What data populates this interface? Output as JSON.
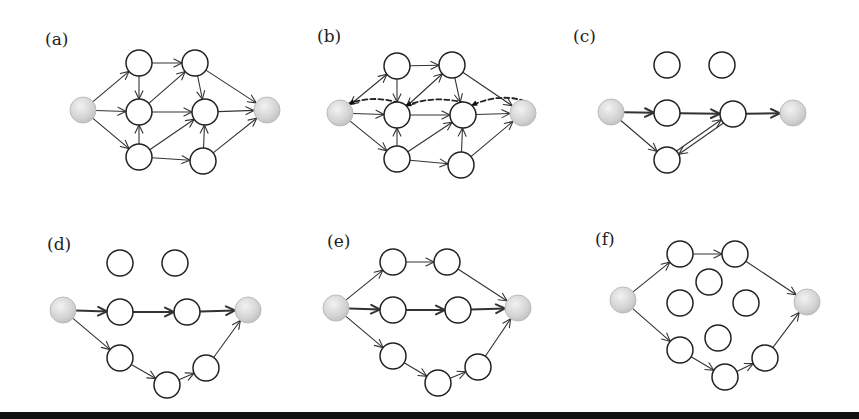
{
  "figure": {
    "node_radius": 13,
    "colors": {
      "node_fill": "#ffffff",
      "node_stroke": "#222222",
      "terminal_fill": "#d8d8d8",
      "edge": "#333333",
      "band": "#111111"
    },
    "panels": [
      {
        "id": "a",
        "label": "(a)",
        "label_pos": [
          45,
          45
        ],
        "nodes": [
          {
            "id": "s",
            "x": 83,
            "y": 110,
            "type": "terminal"
          },
          {
            "id": "a1",
            "x": 139,
            "y": 63
          },
          {
            "id": "a2",
            "x": 195,
            "y": 63
          },
          {
            "id": "b1",
            "x": 139,
            "y": 112
          },
          {
            "id": "b2",
            "x": 205,
            "y": 112
          },
          {
            "id": "c1",
            "x": 139,
            "y": 157
          },
          {
            "id": "c2",
            "x": 203,
            "y": 161
          },
          {
            "id": "t",
            "x": 267,
            "y": 110,
            "type": "terminal"
          }
        ],
        "edges": [
          {
            "from": "s",
            "to": "a1"
          },
          {
            "from": "s",
            "to": "b1"
          },
          {
            "from": "s",
            "to": "c1"
          },
          {
            "from": "a1",
            "to": "a2"
          },
          {
            "from": "a1",
            "to": "b1"
          },
          {
            "from": "c1",
            "to": "b1"
          },
          {
            "from": "b1",
            "to": "a2"
          },
          {
            "from": "b1",
            "to": "b2"
          },
          {
            "from": "c1",
            "to": "b2"
          },
          {
            "from": "c1",
            "to": "c2"
          },
          {
            "from": "a2",
            "to": "b2"
          },
          {
            "from": "c2",
            "to": "b2"
          },
          {
            "from": "a2",
            "to": "t"
          },
          {
            "from": "b2",
            "to": "t"
          },
          {
            "from": "c2",
            "to": "t"
          }
        ]
      },
      {
        "id": "b",
        "label": "(b)",
        "label_pos": [
          317,
          42
        ],
        "nodes": [
          {
            "id": "s",
            "x": 340,
            "y": 113,
            "type": "terminal"
          },
          {
            "id": "a1",
            "x": 397,
            "y": 66
          },
          {
            "id": "a2",
            "x": 452,
            "y": 65
          },
          {
            "id": "b1",
            "x": 397,
            "y": 115
          },
          {
            "id": "b2",
            "x": 463,
            "y": 115
          },
          {
            "id": "c1",
            "x": 397,
            "y": 159
          },
          {
            "id": "c2",
            "x": 461,
            "y": 165
          },
          {
            "id": "t",
            "x": 523,
            "y": 113,
            "type": "terminal"
          }
        ],
        "edges": [
          {
            "from": "s",
            "to": "a1",
            "bidirectional": true
          },
          {
            "from": "s",
            "to": "b1"
          },
          {
            "from": "s",
            "to": "c1"
          },
          {
            "from": "a1",
            "to": "a2"
          },
          {
            "from": "a1",
            "to": "b1"
          },
          {
            "from": "c1",
            "to": "b1"
          },
          {
            "from": "b1",
            "to": "a2",
            "bidirectional": true
          },
          {
            "from": "b1",
            "to": "b2"
          },
          {
            "from": "c1",
            "to": "b2"
          },
          {
            "from": "c1",
            "to": "c2"
          },
          {
            "from": "a2",
            "to": "b2"
          },
          {
            "from": "c2",
            "to": "b2"
          },
          {
            "from": "a2",
            "to": "t"
          },
          {
            "from": "b2",
            "to": "t"
          },
          {
            "from": "c2",
            "to": "t"
          },
          {
            "from": "b1",
            "to": "s",
            "style": "dashed",
            "curve": -14
          },
          {
            "from": "b2",
            "to": "b1",
            "style": "dashed",
            "curve": -14
          },
          {
            "from": "t",
            "to": "b2",
            "style": "dashed",
            "curve": -14
          }
        ]
      },
      {
        "id": "c",
        "label": "(c)",
        "label_pos": [
          573,
          42
        ],
        "nodes": [
          {
            "id": "s",
            "x": 611,
            "y": 112,
            "type": "terminal"
          },
          {
            "id": "i1",
            "x": 667,
            "y": 65
          },
          {
            "id": "i2",
            "x": 722,
            "y": 65
          },
          {
            "id": "b1",
            "x": 667,
            "y": 113
          },
          {
            "id": "b2",
            "x": 733,
            "y": 114
          },
          {
            "id": "c1",
            "x": 667,
            "y": 160
          },
          {
            "id": "t",
            "x": 793,
            "y": 113,
            "type": "terminal"
          }
        ],
        "edges": [
          {
            "from": "s",
            "to": "b1",
            "style": "thick"
          },
          {
            "from": "b1",
            "to": "b2",
            "style": "thick"
          },
          {
            "from": "b2",
            "to": "t",
            "style": "thick"
          },
          {
            "from": "s",
            "to": "c1"
          },
          {
            "from": "c1",
            "to": "b2",
            "offset": -2
          },
          {
            "from": "b2",
            "to": "c1",
            "offset": -2
          }
        ]
      },
      {
        "id": "d",
        "label": "(d)",
        "label_pos": [
          47,
          250
        ],
        "nodes": [
          {
            "id": "s",
            "x": 63,
            "y": 310,
            "type": "terminal"
          },
          {
            "id": "i1",
            "x": 120,
            "y": 263
          },
          {
            "id": "i2",
            "x": 175,
            "y": 263
          },
          {
            "id": "b1",
            "x": 120,
            "y": 312
          },
          {
            "id": "b2",
            "x": 187,
            "y": 312
          },
          {
            "id": "c1",
            "x": 120,
            "y": 358
          },
          {
            "id": "c2",
            "x": 167,
            "y": 385
          },
          {
            "id": "c3",
            "x": 206,
            "y": 368
          },
          {
            "id": "t",
            "x": 248,
            "y": 310,
            "type": "terminal"
          }
        ],
        "edges": [
          {
            "from": "s",
            "to": "b1",
            "style": "thick"
          },
          {
            "from": "b1",
            "to": "b2",
            "style": "thick"
          },
          {
            "from": "b2",
            "to": "t",
            "style": "thick"
          },
          {
            "from": "s",
            "to": "c1"
          },
          {
            "from": "c1",
            "to": "c2"
          },
          {
            "from": "c2",
            "to": "c3"
          },
          {
            "from": "c3",
            "to": "t"
          }
        ]
      },
      {
        "id": "e",
        "label": "(e)",
        "label_pos": [
          327,
          247
        ],
        "nodes": [
          {
            "id": "s",
            "x": 336,
            "y": 308,
            "type": "terminal"
          },
          {
            "id": "a1",
            "x": 393,
            "y": 262
          },
          {
            "id": "a2",
            "x": 447,
            "y": 262
          },
          {
            "id": "b1",
            "x": 393,
            "y": 310
          },
          {
            "id": "b2",
            "x": 458,
            "y": 310
          },
          {
            "id": "c1",
            "x": 393,
            "y": 356
          },
          {
            "id": "c2",
            "x": 438,
            "y": 383
          },
          {
            "id": "c3",
            "x": 478,
            "y": 367
          },
          {
            "id": "t",
            "x": 518,
            "y": 308,
            "type": "terminal"
          }
        ],
        "edges": [
          {
            "from": "s",
            "to": "a1"
          },
          {
            "from": "a1",
            "to": "a2"
          },
          {
            "from": "a2",
            "to": "t"
          },
          {
            "from": "s",
            "to": "b1",
            "style": "thick"
          },
          {
            "from": "b1",
            "to": "b2",
            "style": "thick"
          },
          {
            "from": "b2",
            "to": "t",
            "style": "thick"
          },
          {
            "from": "s",
            "to": "c1"
          },
          {
            "from": "c1",
            "to": "c2"
          },
          {
            "from": "c2",
            "to": "c3"
          },
          {
            "from": "c3",
            "to": "t"
          }
        ]
      },
      {
        "id": "f",
        "label": "(f)",
        "label_pos": [
          595,
          245
        ],
        "nodes": [
          {
            "id": "s",
            "x": 623,
            "y": 300,
            "type": "terminal"
          },
          {
            "id": "a1",
            "x": 680,
            "y": 254
          },
          {
            "id": "a2",
            "x": 735,
            "y": 254
          },
          {
            "id": "m1",
            "x": 709,
            "y": 282
          },
          {
            "id": "m2",
            "x": 680,
            "y": 303
          },
          {
            "id": "m3",
            "x": 746,
            "y": 303
          },
          {
            "id": "m4",
            "x": 718,
            "y": 338
          },
          {
            "id": "c1",
            "x": 680,
            "y": 350
          },
          {
            "id": "c2",
            "x": 725,
            "y": 377
          },
          {
            "id": "c3",
            "x": 765,
            "y": 358
          },
          {
            "id": "t",
            "x": 807,
            "y": 302,
            "type": "terminal"
          }
        ],
        "edges": [
          {
            "from": "s",
            "to": "a1"
          },
          {
            "from": "a1",
            "to": "a2"
          },
          {
            "from": "a2",
            "to": "t"
          },
          {
            "from": "s",
            "to": "c1"
          },
          {
            "from": "c1",
            "to": "c2"
          },
          {
            "from": "c2",
            "to": "c3"
          },
          {
            "from": "c3",
            "to": "t"
          }
        ]
      }
    ]
  }
}
